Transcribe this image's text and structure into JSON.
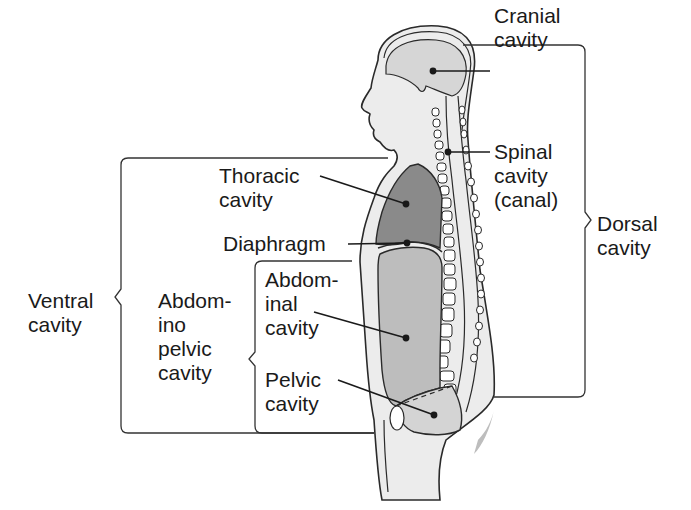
{
  "diagram": {
    "colors": {
      "background": "#ffffff",
      "body_fill": "#ececec",
      "outline": "#2a2a2a",
      "cranial_fill": "#d6d6d6",
      "thoracic_fill": "#8a8a8a",
      "abdominal_fill": "#bdbdbd",
      "pelvic_fill": "#d4d4d4",
      "bracket": "#333333",
      "text": "#1a1a1a"
    },
    "labels": {
      "cranial": "Cranial\ncavity",
      "spinal": "Spinal\ncavity\n(canal)",
      "dorsal": "Dorsal\ncavity",
      "thoracic": "Thoracic\ncavity",
      "diaphragm": "Diaphragm",
      "abdominal": "Abdom-\ninal\ncavity",
      "pelvic": "Pelvic\ncavity",
      "abdominopelvic": "Abdom-\nino\npelvic\ncavity",
      "ventral": "Ventral\ncavity"
    },
    "groups": [
      {
        "name": "Dorsal cavity",
        "members": [
          "Cranial cavity",
          "Spinal cavity (canal)"
        ]
      },
      {
        "name": "Ventral cavity",
        "members": [
          "Thoracic cavity",
          "Abdominopelvic cavity"
        ]
      },
      {
        "name": "Abdominopelvic cavity",
        "members": [
          "Abdominal cavity",
          "Pelvic cavity"
        ]
      }
    ],
    "separator": "Diaphragm"
  }
}
